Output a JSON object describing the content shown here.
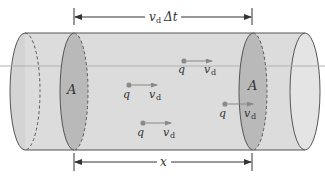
{
  "diagram": {
    "top_dimension": {
      "symbol": "v",
      "subscript": "d",
      "suffix": "Δt"
    },
    "bottom_dimension": {
      "label": "x"
    },
    "cross_sections": [
      {
        "label": "A",
        "position": "left"
      },
      {
        "label": "A",
        "position": "right"
      }
    ],
    "charges": [
      {
        "charge_label": "q",
        "velocity_symbol": "v",
        "velocity_subscript": "d"
      },
      {
        "charge_label": "q",
        "velocity_symbol": "v",
        "velocity_subscript": "d"
      },
      {
        "charge_label": "q",
        "velocity_symbol": "v",
        "velocity_subscript": "d"
      },
      {
        "charge_label": "q",
        "velocity_symbol": "v",
        "velocity_subscript": "d"
      }
    ],
    "colors": {
      "cylinder_fill": "#dcdcdc",
      "cross_section_fill": "#b9b9b9",
      "outline": "#555555",
      "charge_dot": "#8a8a8a",
      "reference_line": "#b0b0b0"
    }
  }
}
